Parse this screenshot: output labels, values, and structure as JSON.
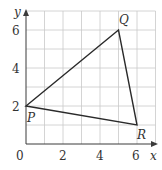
{
  "diagram": {
    "type": "coordinate-grid-triangle",
    "axes": {
      "x_label": "x",
      "y_label": "y",
      "origin_label": "0",
      "x_ticks": [
        "2",
        "4",
        "6"
      ],
      "y_ticks": [
        "2",
        "4",
        "6"
      ],
      "x_range": [
        0,
        7
      ],
      "y_range": [
        0,
        7
      ]
    },
    "points": [
      {
        "label": "P",
        "x": 0,
        "y": 2
      },
      {
        "label": "Q",
        "x": 5,
        "y": 6
      },
      {
        "label": "R",
        "x": 6,
        "y": 1
      }
    ],
    "colors": {
      "grid": "#c9c9c9",
      "axis": "#3a3a3a",
      "triangle": "#2a2a2a",
      "text": "#333333"
    }
  }
}
